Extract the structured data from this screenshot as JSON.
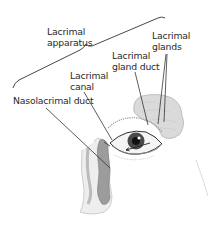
{
  "figure": {
    "labels": {
      "lacrimal_apparatus": [
        "Lacrimal",
        "apparatus"
      ],
      "lacrimal_glands": [
        "Lacrimal",
        "glands"
      ],
      "lacrimal_gland_duct": [
        "Lacrimal",
        "gland duct"
      ],
      "lacrimal_canal": [
        "Lacrimal",
        "canal"
      ],
      "nasolacrimal_duct": [
        "Nasolacrimal duct"
      ]
    },
    "colors": {
      "text": "#2a2a2a",
      "leader_line": "#333333",
      "gland_fill": "#cfcfcf",
      "duct_fill": "#9a9a9a",
      "iris": "#3a3a3a"
    }
  }
}
